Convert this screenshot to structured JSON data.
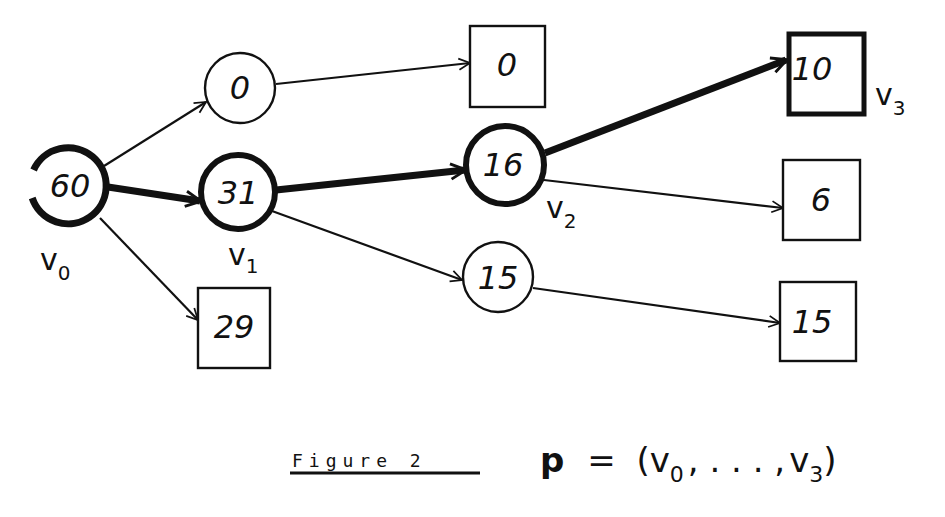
{
  "figure": {
    "caption": "Figure 2",
    "formula": {
      "lhs": "p",
      "eq": "=",
      "open": "(",
      "first": "v",
      "first_sub": "0",
      "middle": ", . . . ,",
      "last": "v",
      "last_sub": "3",
      "close": ")"
    }
  },
  "nodes": [
    {
      "id": "n60",
      "shape": "circle",
      "value": "60",
      "thick": true,
      "vertex_label": "v",
      "vertex_sub": "0"
    },
    {
      "id": "n0c",
      "shape": "circle",
      "value": "0",
      "thick": false
    },
    {
      "id": "n31",
      "shape": "circle",
      "value": "31",
      "thick": true,
      "vertex_label": "v",
      "vertex_sub": "1"
    },
    {
      "id": "n29",
      "shape": "box",
      "value": "29",
      "thick": false
    },
    {
      "id": "n0b",
      "shape": "box",
      "value": "0",
      "thick": false
    },
    {
      "id": "n16",
      "shape": "circle",
      "value": "16",
      "thick": true,
      "vertex_label": "v",
      "vertex_sub": "2"
    },
    {
      "id": "n15c",
      "shape": "circle",
      "value": "15",
      "thick": false
    },
    {
      "id": "n10",
      "shape": "box",
      "value": "10",
      "thick": true,
      "vertex_label": "v",
      "vertex_sub": "3"
    },
    {
      "id": "n6",
      "shape": "box",
      "value": "6",
      "thick": false
    },
    {
      "id": "n15b",
      "shape": "box",
      "value": "15",
      "thick": false
    }
  ],
  "edges": [
    {
      "from": "60",
      "to": "0 (circle)",
      "path": false
    },
    {
      "from": "60",
      "to": "31",
      "path": true
    },
    {
      "from": "60",
      "to": "29",
      "path": false
    },
    {
      "from": "0 (circle)",
      "to": "0 (box)",
      "path": false
    },
    {
      "from": "31",
      "to": "16",
      "path": true
    },
    {
      "from": "31",
      "to": "15 (circle)",
      "path": false
    },
    {
      "from": "16",
      "to": "10",
      "path": true
    },
    {
      "from": "16",
      "to": "6",
      "path": false
    },
    {
      "from": "15 (circle)",
      "to": "15 (box)",
      "path": false
    }
  ],
  "colors": {
    "ink": "#111111",
    "background": "#ffffff"
  }
}
